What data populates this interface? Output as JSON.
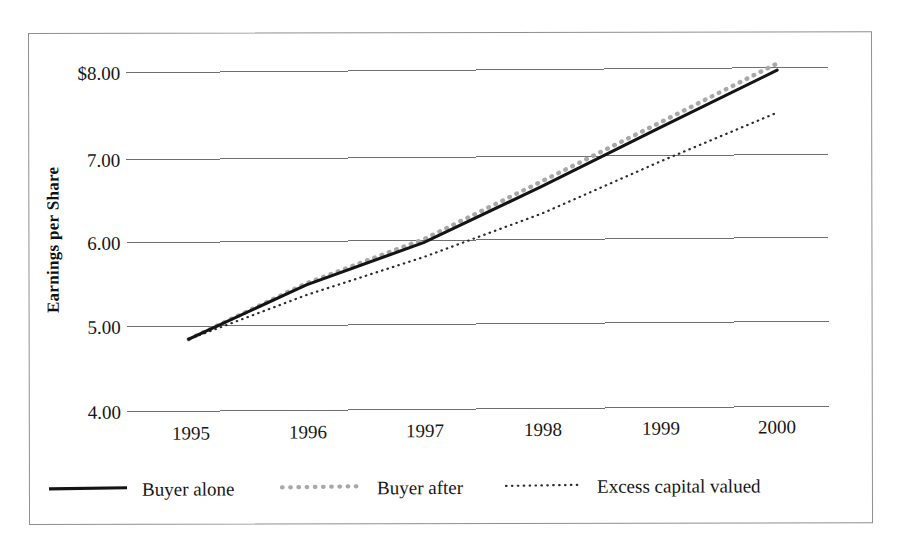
{
  "figure": {
    "border_color": "#8f8f93",
    "background": "#ffffff"
  },
  "chart_data": {
    "type": "line",
    "title": "",
    "xlabel": "",
    "ylabel": "Earnings per Share",
    "categories": [
      "1995",
      "1996",
      "1997",
      "1998",
      "1999",
      "2000"
    ],
    "x": [
      1995,
      1996,
      1997,
      1998,
      1999,
      2000
    ],
    "ylim": [
      4.0,
      8.2
    ],
    "yticks": [
      4.0,
      5.0,
      6.0,
      7.0,
      8.0
    ],
    "ytick_labels": [
      "4.00",
      "5.00",
      "6.00",
      "7.00",
      "$8.00"
    ],
    "grid": "horizontal",
    "legend_position": "below-axis-horizontal",
    "series": [
      {
        "name": "Buyer alone",
        "style": "solid",
        "color": "#141414",
        "values": [
          4.85,
          5.48,
          5.97,
          6.62,
          7.3,
          7.97
        ]
      },
      {
        "name": "Buyer after",
        "style": "thick-dotted",
        "color": "#a8a8a8",
        "values": [
          4.85,
          5.5,
          6.01,
          6.68,
          7.36,
          8.05
        ]
      },
      {
        "name": "Excess capital valued",
        "style": "fine-dotted",
        "color": "#2b2b2b",
        "values": [
          4.85,
          5.36,
          5.8,
          6.3,
          6.9,
          7.47
        ]
      }
    ]
  },
  "axis": {
    "y_title": "Earnings per Share",
    "y_tick_0": "4.00",
    "y_tick_1": "5.00",
    "y_tick_2": "6.00",
    "y_tick_3": "7.00",
    "y_tick_4": "$8.00",
    "x_tick_0": "1995",
    "x_tick_1": "1996",
    "x_tick_2": "1997",
    "x_tick_3": "1998",
    "x_tick_4": "1999",
    "x_tick_5": "2000"
  },
  "legend": {
    "items": [
      {
        "label": "Buyer alone",
        "swatch": "solid-line-swatch"
      },
      {
        "label": "Buyer after",
        "swatch": "gray-dotted-line-swatch"
      },
      {
        "label": "Excess capital valued",
        "swatch": "fine-dotted-line-swatch"
      }
    ]
  }
}
